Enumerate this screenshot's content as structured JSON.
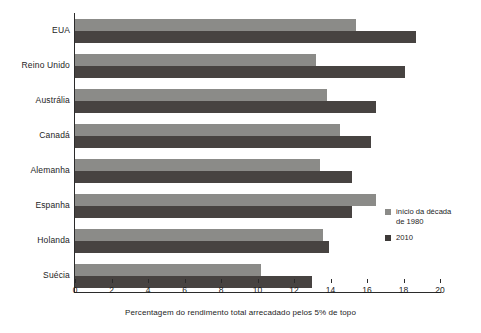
{
  "chart_data": {
    "type": "bar",
    "orientation": "horizontal",
    "title": "",
    "xlabel": "Percentagem do rendimento total arrecadado pelos 5% de topo",
    "ylabel": "",
    "xlim": [
      0,
      20
    ],
    "xticks": [
      0,
      2,
      4,
      6,
      8,
      10,
      12,
      14,
      16,
      18,
      20
    ],
    "grid": false,
    "legend_position": "right-middle",
    "categories": [
      "EUA",
      "Reino Unido",
      "Austrália",
      "Canadá",
      "Alemanha",
      "Espanha",
      "Holanda",
      "Suécia"
    ],
    "series": [
      {
        "name": "início da década\nde 1980",
        "color": "#8b8b88",
        "values": [
          15.4,
          13.2,
          13.8,
          14.5,
          13.4,
          16.5,
          13.6,
          10.2
        ]
      },
      {
        "name": "2010",
        "color": "#474341",
        "values": [
          18.7,
          18.1,
          16.5,
          16.2,
          15.2,
          15.2,
          13.9,
          13.0
        ]
      }
    ]
  },
  "axis": {
    "tick_labels": [
      "0",
      "2",
      "4",
      "6",
      "8",
      "10",
      "12",
      "14",
      "16",
      "18",
      "20"
    ],
    "x_title": "Percentagem do rendimento total arrecadado pelos 5% de topo"
  },
  "categories": [
    "EUA",
    "Reino Unido",
    "Austrália",
    "Canadá",
    "Alemanha",
    "Espanha",
    "Holanda",
    "Suécia"
  ],
  "legend": {
    "items": [
      {
        "label": "início da década\nde 1980",
        "color": "#8b8b88"
      },
      {
        "label": "2010",
        "color": "#3d3a38"
      }
    ]
  },
  "colors": {
    "series_old": "#8b8b88",
    "series_new": "#474341",
    "axis": "#2b2b2b",
    "text": "#1d1d1d",
    "background": "#ffffff"
  }
}
